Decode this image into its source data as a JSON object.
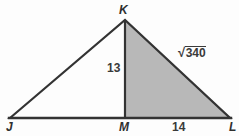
{
  "figure": {
    "type": "geometry-diagram",
    "background_color": "#fdfdfd",
    "stroke_color": "#333333",
    "shaded_fill_color": "#b8b8b8",
    "label_color": "#3a3a3a",
    "vertices": [
      {
        "name": "K",
        "label": "K",
        "x": 125,
        "y": 20
      },
      {
        "name": "J",
        "label": "J",
        "x": 10,
        "y": 118
      },
      {
        "name": "M",
        "label": "M",
        "x": 125,
        "y": 118
      },
      {
        "name": "L",
        "label": "L",
        "x": 230,
        "y": 118
      }
    ],
    "segments": [
      {
        "name": "JK",
        "from": "J",
        "to": "K"
      },
      {
        "name": "KL",
        "from": "K",
        "to": "L"
      },
      {
        "name": "JL",
        "from": "J",
        "to": "L"
      },
      {
        "name": "KM",
        "from": "K",
        "to": "M"
      }
    ],
    "shaded_region": {
      "name": "triangle-KML",
      "points": "K,M,L"
    },
    "measures": {
      "altitude": "13",
      "base_segment_ML": "14",
      "hypotenuse_KL_sign": "√",
      "hypotenuse_KL_radicand": "340",
      "hypotenuse_KL": "√340"
    }
  }
}
